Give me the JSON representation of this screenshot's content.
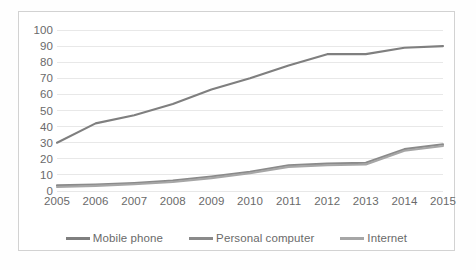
{
  "chart_data": {
    "type": "line",
    "title": "",
    "subtitle": "",
    "xlabel": "",
    "ylabel": "",
    "categories": [
      "2005",
      "2006",
      "2007",
      "2008",
      "2009",
      "2010",
      "2011",
      "2012",
      "2013",
      "2014",
      "2015"
    ],
    "x": [
      2005,
      2006,
      2007,
      2008,
      2009,
      2010,
      2011,
      2012,
      2013,
      2014,
      2015
    ],
    "series": [
      {
        "name": "Mobile phone",
        "color": "#7f7f7f",
        "values": [
          30,
          42,
          47,
          54,
          63,
          70,
          78,
          85,
          85,
          89,
          90
        ]
      },
      {
        "name": "Personal computer",
        "color": "#8a8a8a",
        "values": [
          3.5,
          4,
          5,
          6.5,
          9,
          12,
          16,
          17,
          17.5,
          26,
          29
        ]
      },
      {
        "name": "Internet",
        "color": "#a6a6a6",
        "values": [
          2.5,
          3.2,
          4.2,
          5.6,
          8,
          11,
          15,
          16,
          16.5,
          25,
          28
        ]
      }
    ],
    "ylim": [
      0,
      100
    ],
    "ytick_step": 10,
    "yticks": [
      0,
      10,
      20,
      30,
      40,
      50,
      60,
      70,
      80,
      90,
      100
    ],
    "grid": true,
    "grid_axis": "y",
    "grid_color": "#e8e8e8",
    "legend_position": "bottom",
    "plot_background": "#ffffff",
    "frame_border_color": "#d2d2d2",
    "tick_label_color": "#6a6a6a"
  },
  "legend": {
    "entries": [
      {
        "label": "Mobile phone"
      },
      {
        "label": "Personal computer"
      },
      {
        "label": "Internet"
      }
    ]
  }
}
